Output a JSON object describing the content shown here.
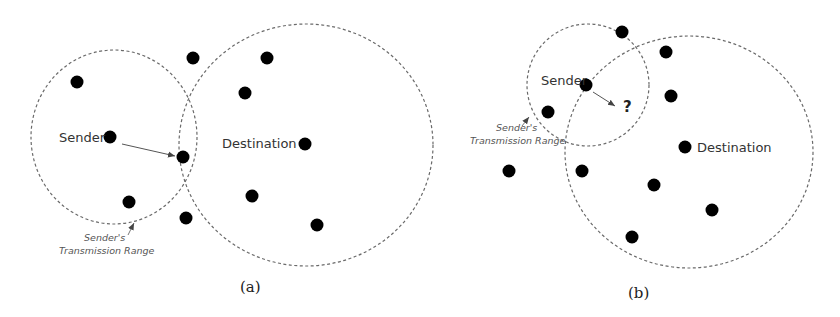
{
  "colors": {
    "background": "#ffffff",
    "node": "#000000",
    "range_circle": "#666666",
    "arrow": "#555555",
    "label_text": "#333333"
  },
  "panels": [
    {
      "id": "a",
      "caption": "(a)",
      "sender_label": "Sender",
      "destination_label": "Destination",
      "range_label_line1": "Sender's",
      "range_label_line2": "Transmission Range",
      "sender_range_circle": {
        "cx": 114,
        "cy": 137,
        "rx": 83,
        "ry": 87
      },
      "destination_range_circle": {
        "cx": 306,
        "cy": 145,
        "rx": 127,
        "ry": 121
      },
      "sender_node": {
        "x": 110,
        "y": 137
      },
      "destination_node": {
        "x": 305,
        "y": 144
      },
      "next_hop_node": {
        "x": 183,
        "y": 157
      },
      "other_nodes": [
        {
          "x": 77,
          "y": 82
        },
        {
          "x": 193,
          "y": 58
        },
        {
          "x": 267,
          "y": 58
        },
        {
          "x": 245,
          "y": 93
        },
        {
          "x": 129,
          "y": 202
        },
        {
          "x": 252,
          "y": 196
        },
        {
          "x": 186,
          "y": 218
        },
        {
          "x": 317,
          "y": 225
        }
      ]
    },
    {
      "id": "b",
      "caption": "(b)",
      "sender_label": "Sender",
      "destination_label": "Destination",
      "unknown_next_hop": "?",
      "range_label_line1": "Sender's",
      "range_label_line2": "Transmission Range",
      "sender_range_circle": {
        "cx": 588,
        "cy": 85,
        "rx": 61,
        "ry": 61
      },
      "destination_range_circle": {
        "cx": 689,
        "cy": 152,
        "rx": 124,
        "ry": 116
      },
      "sender_node": {
        "x": 586,
        "y": 85
      },
      "destination_node": {
        "x": 685,
        "y": 147
      },
      "other_nodes": [
        {
          "x": 622,
          "y": 32
        },
        {
          "x": 666,
          "y": 52
        },
        {
          "x": 671,
          "y": 96
        },
        {
          "x": 548,
          "y": 112
        },
        {
          "x": 509,
          "y": 171
        },
        {
          "x": 582,
          "y": 171
        },
        {
          "x": 654,
          "y": 185
        },
        {
          "x": 712,
          "y": 210
        },
        {
          "x": 632,
          "y": 237
        }
      ]
    }
  ]
}
